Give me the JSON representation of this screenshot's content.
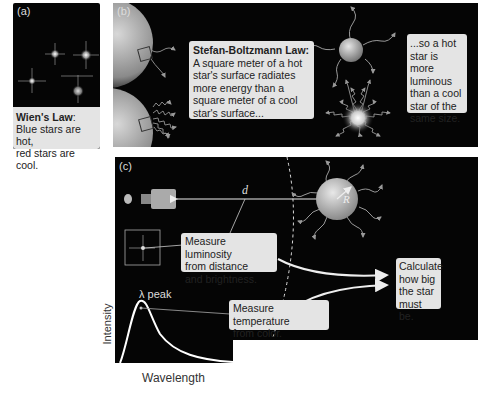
{
  "panel_a": {
    "label": "(a)",
    "caption_title": "Wien's Law",
    "caption_colon": ":",
    "caption_body_1": "Blue stars are hot,",
    "caption_body_2": "red stars are cool."
  },
  "panel_b": {
    "label": "(b)",
    "box1_title": "Stefan-Boltzmann Law:",
    "box1_lines": [
      "A square meter of a hot",
      "star's surface radiates",
      "more energy than a",
      "square meter of a cool",
      "star's surface..."
    ],
    "box2_lines": [
      "...so a hot",
      "star is more",
      "luminous",
      "than a cool",
      "star of the",
      "same size."
    ]
  },
  "panel_c": {
    "label": "(c)",
    "distance_symbol": "d",
    "radius_symbol": "R",
    "box_luminosity": [
      "Measure luminosity",
      "from distance",
      "and brightness."
    ],
    "box_temperature": [
      "Measure temperature",
      "from color."
    ],
    "box_calculate": [
      "Calculate",
      "how big",
      "the star",
      "must be."
    ]
  },
  "spectrum_plot": {
    "peak_label": "λ peak",
    "xlabel": "Wavelength",
    "ylabel": "Intensity"
  },
  "colors": {
    "panel_bg": "#050505",
    "box_bg": "#e4e4e4",
    "text": "#222222"
  }
}
